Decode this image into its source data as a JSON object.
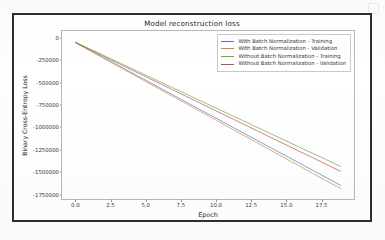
{
  "figure": {
    "title": "Model reconstruction loss",
    "background_color": "#ffffff",
    "frame_color": "#2e2e2e"
  },
  "axis": {
    "xlabel": "Epoch",
    "ylabel": "Binary Cross-Entropy Loss",
    "xticks": [
      "0.0",
      "2.5",
      "5.0",
      "7.5",
      "10.0",
      "12.5",
      "15.0",
      "17.5"
    ],
    "yticks": [
      "0",
      "-250000",
      "-500000",
      "-750000",
      "-1000000",
      "-1250000",
      "-1500000",
      "-1750000"
    ]
  },
  "legend": {
    "position": "upper right",
    "entries": [
      {
        "label": "With Batch Normalization - Training",
        "color": "#4a7ebb"
      },
      {
        "label": "With Batch Normalization - Validation",
        "color": "#d1893f"
      },
      {
        "label": "Without Batch Normalization - Training",
        "color": "#6aa84f"
      },
      {
        "label": "Without Batch Normalization - Validation",
        "color": "#c0504d"
      }
    ]
  },
  "chart_data": {
    "type": "line",
    "title": "Model reconstruction loss",
    "xlabel": "Epoch",
    "ylabel": "Binary Cross-Entropy Loss",
    "xlim": [
      -0.95,
      19.95
    ],
    "ylim": [
      -1820000,
      75000
    ],
    "xticks": [
      0.0,
      2.5,
      5.0,
      7.5,
      10.0,
      12.5,
      15.0,
      17.5
    ],
    "yticks": [
      0,
      -250000,
      -500000,
      -750000,
      -1000000,
      -1250000,
      -1500000,
      -1750000
    ],
    "grid": false,
    "legend_position": "upper right",
    "x": [
      0,
      1,
      2,
      3,
      4,
      5,
      6,
      7,
      8,
      9,
      10,
      11,
      12,
      13,
      14,
      15,
      16,
      17,
      18,
      19
    ],
    "series": [
      {
        "name": "With Batch Normalization - Training",
        "color": "#4a7ebb",
        "values": [
          -52000,
          -137000,
          -222000,
          -307000,
          -392000,
          -477000,
          -562000,
          -647000,
          -732000,
          -817000,
          -902000,
          -987000,
          -1072000,
          -1157000,
          -1242000,
          -1327000,
          -1412000,
          -1497000,
          -1582000,
          -1667000
        ]
      },
      {
        "name": "With Batch Normalization - Validation",
        "color": "#d1893f",
        "values": [
          -58000,
          -144000,
          -231000,
          -318000,
          -404000,
          -491000,
          -578000,
          -664000,
          -751000,
          -838000,
          -924000,
          -1011000,
          -1098000,
          -1184000,
          -1271000,
          -1358000,
          -1444000,
          -1531000,
          -1618000,
          -1702000
        ]
      },
      {
        "name": "Without Batch Normalization - Training",
        "color": "#6aa84f",
        "values": [
          -50000,
          -124000,
          -198000,
          -272000,
          -345000,
          -419000,
          -493000,
          -567000,
          -641000,
          -715000,
          -789000,
          -862000,
          -936000,
          -1010000,
          -1084000,
          -1158000,
          -1232000,
          -1305000,
          -1379000,
          -1453000
        ]
      },
      {
        "name": "Without Batch Normalization - Validation",
        "color": "#c0504d",
        "values": [
          -55000,
          -131000,
          -208000,
          -284000,
          -361000,
          -437000,
          -514000,
          -590000,
          -667000,
          -743000,
          -820000,
          -896000,
          -973000,
          -1049000,
          -1126000,
          -1202000,
          -1279000,
          -1355000,
          -1432000,
          -1508000
        ]
      }
    ]
  }
}
